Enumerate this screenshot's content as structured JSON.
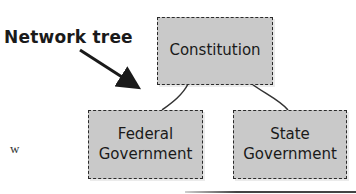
{
  "diagram": {
    "type": "tree",
    "annotation": {
      "label": "Network tree",
      "arrow": "points to tree"
    },
    "nodes": [
      {
        "id": "root",
        "label": "Constitution",
        "parent": null
      },
      {
        "id": "federal",
        "label": "Federal\nGovernment",
        "parent": "root"
      },
      {
        "id": "state",
        "label": "State\nGovernment",
        "parent": "root"
      }
    ],
    "root_label": "Constitution",
    "federal_line1": "Federal",
    "federal_line2": "Government",
    "state_line1": "State",
    "state_line2": "Government",
    "side_text_fragment": "w",
    "colors": {
      "node_fill": "#c9c9c9",
      "node_border": "#2a2a2a",
      "text": "#1a1a1a"
    }
  }
}
